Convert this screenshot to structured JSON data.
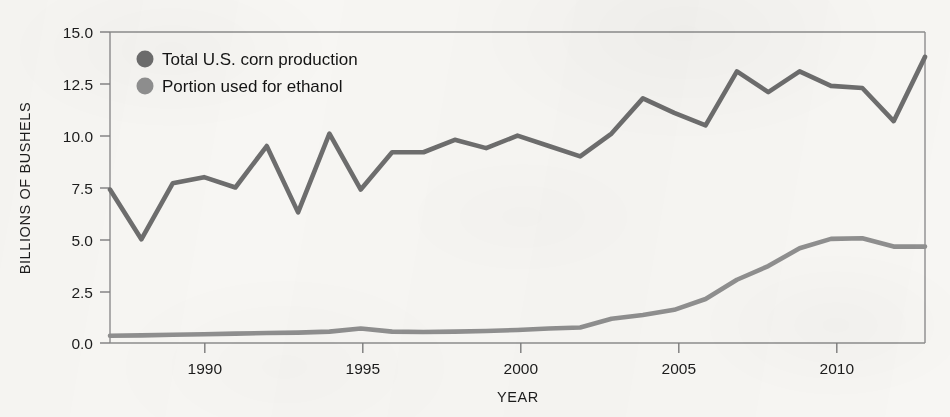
{
  "chart_data": {
    "type": "line",
    "title": "",
    "xlabel": "YEAR",
    "ylabel": "BILLIONS OF BUSHELS",
    "xlim": [
      1987,
      2013
    ],
    "ylim": [
      0.0,
      15.0
    ],
    "grid": false,
    "legend_position": "top-left",
    "x_tick_labels": [
      "1990",
      "1995",
      "2000",
      "2005",
      "2010"
    ],
    "x_ticks": [
      1990,
      1995,
      2000,
      2005,
      2010
    ],
    "y_tick_labels": [
      "15.0",
      "12.5",
      "10.0",
      "7.5",
      "5.0",
      "2.5",
      "0.0"
    ],
    "y_ticks": [
      15.0,
      12.5,
      10.0,
      7.5,
      5.0,
      2.5,
      0.0
    ],
    "x": [
      1987,
      1988,
      1989,
      1990,
      1991,
      1992,
      1993,
      1994,
      1995,
      1996,
      1997,
      1998,
      1999,
      2000,
      2001,
      2002,
      2003,
      2004,
      2005,
      2006,
      2007,
      2008,
      2009,
      2010,
      2011,
      2012,
      2013
    ],
    "series": [
      {
        "name": "Total U.S. corn production",
        "color": "#6d6d6d",
        "values": [
          7.4,
          5.0,
          7.7,
          8.0,
          7.5,
          9.5,
          6.3,
          10.1,
          7.4,
          9.2,
          9.2,
          9.8,
          9.4,
          10.0,
          9.5,
          9.0,
          10.1,
          11.8,
          11.1,
          10.5,
          13.1,
          12.1,
          13.1,
          12.4,
          12.3,
          10.7,
          13.8
        ],
        "values_note": "y-values read off axis, billions of bushels"
      },
      {
        "name": "Portion used for ethanol",
        "color": "#8f8f8f",
        "values": [
          0.35,
          0.37,
          0.4,
          0.42,
          0.45,
          0.48,
          0.5,
          0.55,
          0.7,
          0.55,
          0.53,
          0.55,
          0.58,
          0.63,
          0.7,
          0.75,
          1.17,
          1.35,
          1.6,
          2.12,
          3.05,
          3.71,
          4.57,
          5.02,
          5.05,
          4.65,
          4.65
        ],
        "values_note": "y-values read off axis, billions of bushels"
      }
    ],
    "legend": [
      {
        "label": "Total U.S. corn production",
        "marker": "circle",
        "color": "#6d6d6d"
      },
      {
        "label": "Portion used for ethanol",
        "marker": "circle",
        "color": "#8f8f8f"
      }
    ]
  },
  "colors": {
    "background": "#f7f6f3",
    "axis": "#7a7a7a",
    "text": "#1c1c1c",
    "corn_line": "#6d6d6d",
    "ethanol_line": "#8f8f8f"
  }
}
